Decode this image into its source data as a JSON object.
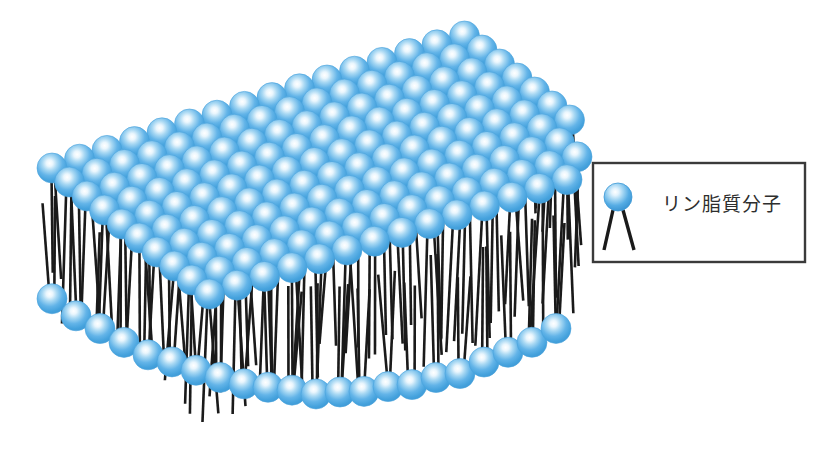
{
  "figure": {
    "title_visible": false,
    "background_color": "#ffffff"
  },
  "colors": {
    "sphere_highlight": "#ffffff",
    "sphere_mid": "#7fc4ee",
    "sphere_base": "#4da6e0",
    "sphere_edge": "#2f86c4",
    "tail_color": "#1a1a1a",
    "legend_border": "#3a3a3a",
    "legend_text_color": "#2e2e2e",
    "background": "#ffffff"
  },
  "legend": {
    "box": {
      "x": 593,
      "y": 163,
      "width": 212,
      "height": 99
    },
    "icon": {
      "name": "phospholipid-molecule-icon",
      "sphere_cx": 618,
      "sphere_cy": 197,
      "sphere_r": 14,
      "tails": [
        {
          "x1": 613,
          "y1": 210,
          "x2": 604,
          "y2": 250
        },
        {
          "x1": 623,
          "y1": 210,
          "x2": 634,
          "y2": 250
        }
      ]
    },
    "label": "リン脂質分子"
  },
  "bilayer": {
    "upper_leaflet": {
      "name": "upper-leaflet",
      "sphere_radius": 15,
      "rows": 10,
      "cols": 16,
      "origin_x": 52,
      "origin_y": 168,
      "col_step_x": 27.5,
      "col_step_y": -8.8,
      "row_step_x": 17.5,
      "row_step_y": 14.0,
      "tail_length": 118,
      "tail_count_per_head": 2
    },
    "lower_leaflet": {
      "name": "lower-leaflet",
      "sphere_radius": 15,
      "count": 22,
      "origin_x": 52,
      "origin_y": 300,
      "step_x": 24.0,
      "sag_amount": 92,
      "tail_length": 104,
      "tail_count_per_head": 2
    }
  },
  "chart_data": {
    "type": "diagram",
    "legend_entries": [
      {
        "symbol": "sphere-with-two-tails",
        "label": "リン脂質分子"
      }
    ],
    "elements": [
      {
        "name": "upper leaflet heads",
        "count": 160,
        "color": "#4da6e0"
      },
      {
        "name": "upper leaflet tails",
        "count": 320,
        "color": "#1a1a1a"
      },
      {
        "name": "lower leaflet heads",
        "count": 22,
        "color": "#4da6e0"
      },
      {
        "name": "lower leaflet tails",
        "count": 44,
        "color": "#1a1a1a"
      }
    ]
  }
}
